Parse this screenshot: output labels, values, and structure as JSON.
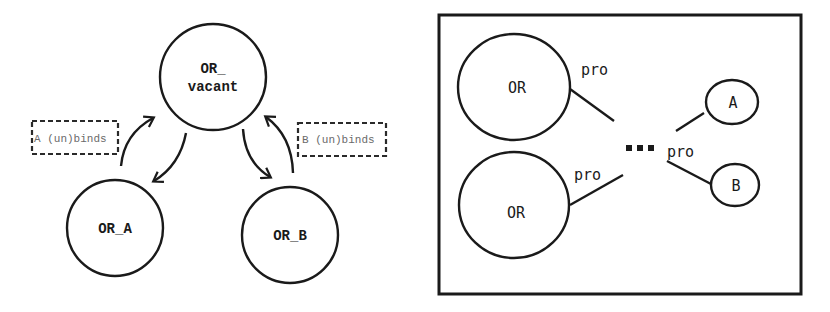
{
  "left_diagram": {
    "nodes": [
      {
        "id": "vacant",
        "line1": "OR_",
        "line2": "vacant"
      },
      {
        "id": "or_a",
        "label": "OR_A"
      },
      {
        "id": "or_b",
        "label": "OR_B"
      }
    ],
    "annotations": [
      {
        "id": "a_binds",
        "label": "A (un)binds"
      },
      {
        "id": "b_binds",
        "label": "B (un)binds"
      }
    ],
    "edges": [
      {
        "from": "or_a",
        "to": "vacant"
      },
      {
        "from": "vacant",
        "to": "or_a"
      },
      {
        "from": "vacant",
        "to": "or_b"
      },
      {
        "from": "or_b",
        "to": "vacant"
      }
    ]
  },
  "right_diagram": {
    "nodes": [
      {
        "id": "or_top",
        "label": "OR"
      },
      {
        "id": "or_bottom",
        "label": "OR"
      },
      {
        "id": "a",
        "label": "A"
      },
      {
        "id": "b",
        "label": "B"
      }
    ],
    "edge_labels": {
      "top": "pro",
      "bottom": "pro",
      "middle": "pro"
    },
    "ellipsis": "■■■"
  },
  "colors": {
    "stroke": "#1a1a1a",
    "annotation_text": "#6a6a6a",
    "background": "#ffffff"
  }
}
